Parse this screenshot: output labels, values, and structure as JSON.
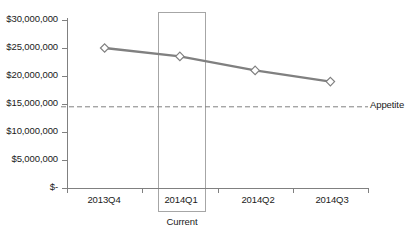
{
  "chart_data": {
    "type": "line",
    "title": "",
    "xlabel": "",
    "ylabel": "",
    "categories": [
      "2013Q4",
      "2014Q1",
      "2014Q2",
      "2014Q3"
    ],
    "series": [
      {
        "name": "Exposure",
        "values": [
          25000000,
          23500000,
          21000000,
          19000000
        ],
        "color": "#808080",
        "marker": "diamond"
      }
    ],
    "ylim": [
      0,
      30000000
    ],
    "ytick_values": [
      0,
      5000000,
      10000000,
      15000000,
      20000000,
      25000000,
      30000000
    ],
    "ytick_labels": [
      "$-",
      "$5,000,000",
      "$10,000,000",
      "$15,000,000",
      "$20,000,000",
      "$25,000,000",
      "$30,000,000"
    ],
    "grid": false,
    "legend": "none",
    "annotations": [
      {
        "name": "appetite-threshold",
        "type": "hline",
        "value": 14500000,
        "label": "Appetite",
        "style": "dashed",
        "color": "#808080"
      },
      {
        "name": "current-period-highlight",
        "type": "vspan",
        "category": "2014Q1",
        "label": "Current",
        "border_color": "#a6a6a6"
      }
    ]
  },
  "axes": {
    "y": {
      "ticks": [
        {
          "label": "$30,000,000",
          "value": 30000000
        },
        {
          "label": "$25,000,000",
          "value": 25000000
        },
        {
          "label": "$20,000,000",
          "value": 20000000
        },
        {
          "label": "$15,000,000",
          "value": 15000000
        },
        {
          "label": "$10,000,000",
          "value": 10000000
        },
        {
          "label": "$5,000,000",
          "value": 5000000
        },
        {
          "label": "$-",
          "value": 0
        }
      ]
    },
    "x": {
      "ticks": [
        {
          "label": "2013Q4"
        },
        {
          "label": "2014Q1"
        },
        {
          "label": "2014Q2"
        },
        {
          "label": "2014Q3"
        }
      ]
    }
  },
  "labels": {
    "appetite": "Appetite",
    "current": "Current"
  },
  "colors": {
    "series_line": "#808080",
    "axis": "#808080",
    "threshold": "#808080",
    "highlight_border": "#a6a6a6",
    "text": "#1a1a1a",
    "background": "#ffffff"
  }
}
